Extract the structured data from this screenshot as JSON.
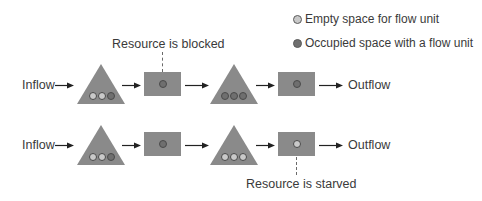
{
  "legend": {
    "items": [
      {
        "state": "empty",
        "label": "Empty space for flow unit"
      },
      {
        "state": "occupied",
        "label": "Occupied space with a flow unit"
      }
    ]
  },
  "colors": {
    "shape_fill": "#8a8a8a",
    "empty_unit": "#c9c9c9",
    "occupied_unit": "#6f6f6f",
    "text": "#3a3a3a"
  },
  "annotations": {
    "blocked": "Resource is blocked",
    "starved": "Resource is starved"
  },
  "rows": [
    {
      "inflow_label": "Inflow",
      "outflow_label": "Outflow",
      "buffer1": [
        "empty",
        "empty",
        "occupied"
      ],
      "resource1": "occupied",
      "resource1_status": "blocked",
      "buffer2": [
        "occupied",
        "occupied",
        "occupied"
      ],
      "resource2": "occupied"
    },
    {
      "inflow_label": "Inflow",
      "outflow_label": "Outflow",
      "buffer1": [
        "empty",
        "empty",
        "occupied"
      ],
      "resource1": "occupied",
      "buffer2": [
        "empty",
        "empty",
        "empty"
      ],
      "resource2": "empty",
      "resource2_status": "starved"
    }
  ]
}
